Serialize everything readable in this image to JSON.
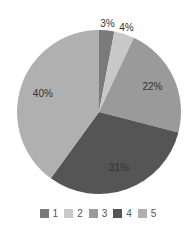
{
  "chart_data": {
    "type": "pie",
    "title": "",
    "categories": [
      "1",
      "2",
      "3",
      "4",
      "5"
    ],
    "values": [
      3,
      4,
      22,
      31,
      40
    ],
    "labels": [
      "3%",
      "4%",
      "22%",
      "31%",
      "40%"
    ],
    "colors": [
      "#7a7a7a",
      "#c8c8c8",
      "#9a9a9a",
      "#555555",
      "#b0b0b0"
    ],
    "start_angle": "top, clockwise",
    "legend_position": "bottom"
  },
  "legend": {
    "items": [
      {
        "label": "1",
        "color": "#7a7a7a"
      },
      {
        "label": "2",
        "color": "#c8c8c8"
      },
      {
        "label": "3",
        "color": "#9a9a9a"
      },
      {
        "label": "4",
        "color": "#555555"
      },
      {
        "label": "5",
        "color": "#b0b0b0"
      }
    ]
  }
}
